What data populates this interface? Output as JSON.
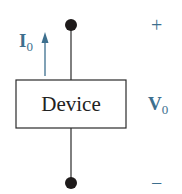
{
  "diagram": {
    "type": "circuit-element",
    "device_label": "Device",
    "current": {
      "symbol": "I",
      "subscript": "0",
      "direction": "up"
    },
    "voltage": {
      "symbol": "V",
      "subscript": "0",
      "positive_sign": "+",
      "negative_sign": "−"
    },
    "colors": {
      "wire": "#2a2a2a",
      "terminal": "#1e1a1a",
      "accent": "#3d6f8e",
      "text": "#222222"
    }
  }
}
